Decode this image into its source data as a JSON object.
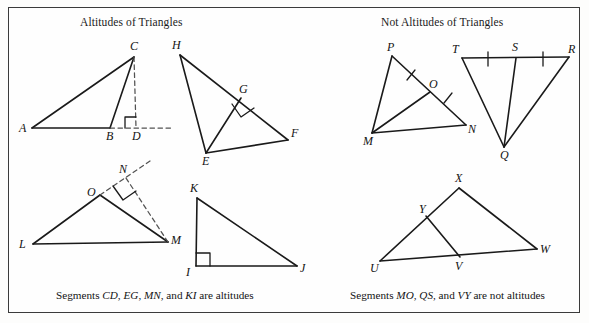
{
  "figure": {
    "title_left": "Altitudes of Triangles",
    "title_right": "Not Altitudes of Triangles",
    "caption_left": "Segments CD, EG, MN, and KI are altitudes",
    "caption_right": "Segments MO, QS, and VY are not altitudes",
    "caption_left_parts": {
      "lead": "Segments ",
      "seg1": "CD",
      "sep1": ", ",
      "seg2": "EG",
      "sep2": ", ",
      "seg3": "MN",
      "sep3": ", and ",
      "seg4": "KI",
      "tail": " are altitudes"
    },
    "caption_right_parts": {
      "lead": "Segments ",
      "seg1": "MO",
      "sep1": ", ",
      "seg2": "QS",
      "sep2": ", and ",
      "seg3": "VY",
      "tail": " are not altitudes"
    },
    "stroke_color": "#1a1a1a",
    "dash_color": "#4a4a4a",
    "frame_color": "#3b3b3b",
    "background_color": "#fefefe"
  },
  "labels": {
    "A": "A",
    "B": "B",
    "C": "C",
    "D": "D",
    "E": "E",
    "F": "F",
    "G": "G",
    "H": "H",
    "I": "I",
    "J": "J",
    "K": "K",
    "L": "L",
    "M1": "M",
    "N1": "N",
    "O1": "O",
    "M2": "M",
    "N2": "N",
    "O2": "O",
    "P": "P",
    "Q": "Q",
    "R": "R",
    "S": "S",
    "T": "T",
    "U": "U",
    "V": "V",
    "W": "W",
    "X": "X",
    "Y": "Y"
  },
  "diagrams": [
    {
      "name": "triangle-abc-altitude-cd",
      "group": "altitudes",
      "vertices": {
        "A": [
          32,
          128
        ],
        "B": [
          110,
          128
        ],
        "C": [
          134,
          57
        ],
        "D": [
          136,
          128
        ]
      },
      "solid_segments": [
        [
          "A",
          "B"
        ],
        [
          "A",
          "C"
        ],
        [
          "B",
          "C"
        ]
      ],
      "dashed_segments": [
        [
          "C",
          "D"
        ],
        [
          "B",
          "D"
        ]
      ],
      "dashed_extension": [
        [
          136,
          128
        ],
        [
          172,
          128
        ]
      ],
      "right_angle_at": "D",
      "altitude": "CD"
    },
    {
      "name": "triangle-hef-altitude-eg",
      "group": "altitudes",
      "vertices": {
        "H": [
          180,
          55
        ],
        "E": [
          206,
          153
        ],
        "F": [
          288,
          140
        ],
        "G": [
          241,
          98
        ]
      },
      "solid_segments": [
        [
          "H",
          "E"
        ],
        [
          "H",
          "F"
        ],
        [
          "E",
          "F"
        ],
        [
          "E",
          "G"
        ]
      ],
      "right_angle_at": "G",
      "altitude": "EG"
    },
    {
      "name": "triangle-lom-altitude-mn",
      "group": "altitudes",
      "vertices": {
        "L": [
          33,
          244
        ],
        "O": [
          100,
          195
        ],
        "M": [
          168,
          242
        ],
        "N": [
          126,
          178
        ]
      },
      "solid_segments": [
        [
          "L",
          "O"
        ],
        [
          "L",
          "M"
        ],
        [
          "O",
          "M"
        ]
      ],
      "dashed_segments": [
        [
          "M",
          "N"
        ],
        [
          "O",
          "N"
        ]
      ],
      "dashed_extension": [
        [
          126,
          178
        ],
        [
          148,
          163
        ]
      ],
      "right_angle_at": "N",
      "altitude": "MN"
    },
    {
      "name": "triangle-kij-altitude-ki",
      "group": "altitudes",
      "vertices": {
        "K": [
          197,
          198
        ],
        "I": [
          196,
          266
        ],
        "J": [
          297,
          266
        ]
      },
      "solid_segments": [
        [
          "K",
          "I"
        ],
        [
          "K",
          "J"
        ],
        [
          "I",
          "J"
        ]
      ],
      "right_angle_at": "I",
      "altitude": "KI"
    },
    {
      "name": "triangle-pmn-median-mo",
      "group": "not-altitudes",
      "vertices": {
        "P": [
          392,
          56
        ],
        "M": [
          372,
          133
        ],
        "N": [
          466,
          125
        ],
        "O": [
          430,
          92
        ]
      },
      "solid_segments": [
        [
          "P",
          "M"
        ],
        [
          "P",
          "N"
        ],
        [
          "M",
          "N"
        ],
        [
          "M",
          "O"
        ]
      ],
      "tick_marks": [
        {
          "on": [
            "P",
            "O"
          ],
          "count": 1
        },
        {
          "on": [
            "O",
            "N"
          ],
          "count": 1
        }
      ],
      "non_altitude": "MO"
    },
    {
      "name": "triangle-trq-median-qs",
      "group": "not-altitudes",
      "vertices": {
        "T": [
          462,
          58
        ],
        "S": [
          516,
          58
        ],
        "R": [
          569,
          57
        ],
        "Q": [
          504,
          147
        ]
      },
      "solid_segments": [
        [
          "T",
          "R"
        ],
        [
          "T",
          "Q"
        ],
        [
          "R",
          "Q"
        ],
        [
          "Q",
          "S"
        ]
      ],
      "tick_marks": [
        {
          "on": [
            "T",
            "S"
          ],
          "count": 1
        },
        {
          "on": [
            "S",
            "R"
          ],
          "count": 1
        }
      ],
      "non_altitude": "QS"
    },
    {
      "name": "triangle-uxw-segment-vy",
      "group": "not-altitudes",
      "vertices": {
        "X": [
          459,
          188
        ],
        "U": [
          380,
          261
        ],
        "W": [
          537,
          249
        ],
        "Y": [
          426,
          216
        ],
        "V": [
          460,
          257
        ]
      },
      "solid_segments": [
        [
          "U",
          "X"
        ],
        [
          "X",
          "W"
        ],
        [
          "U",
          "W"
        ],
        [
          "Y",
          "V"
        ]
      ],
      "non_altitude": "VY"
    }
  ]
}
